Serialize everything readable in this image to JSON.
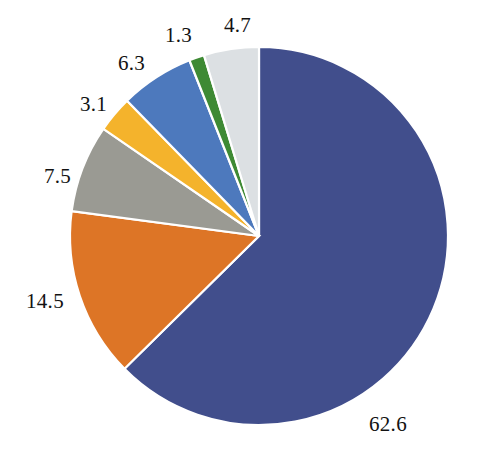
{
  "chart_data": {
    "type": "pie",
    "title": "",
    "subtitle": "",
    "xlabel": "",
    "ylabel": "",
    "grid": false,
    "legend_position": "none",
    "start_angle_deg": 0,
    "direction": "clockwise",
    "center": {
      "x": 259,
      "y": 236
    },
    "radius": 189,
    "categories": [
      "Segment 1",
      "Segment 2",
      "Segment 3",
      "Segment 4",
      "Segment 5",
      "Segment 6",
      "Segment 7"
    ],
    "values": [
      62.6,
      14.5,
      7.5,
      3.1,
      6.3,
      1.3,
      4.7
    ],
    "labels": [
      "62.6",
      "14.5",
      "7.5",
      "3.1",
      "6.3",
      "1.3",
      "4.7"
    ],
    "colors": [
      "#414E8C",
      "#DD7526",
      "#9A9A93",
      "#F4B32C",
      "#4D79BD",
      "#3E8A34",
      "#DCE0E3"
    ],
    "slices": [
      {
        "name": "slice-62-6",
        "label": "62.6",
        "value": 62.6,
        "color": "#414E8C",
        "label_pos": {
          "left": 369,
          "top": 414
        }
      },
      {
        "name": "slice-14-5",
        "label": "14.5",
        "value": 14.5,
        "color": "#DD7526",
        "label_pos": {
          "left": 26,
          "top": 291
        }
      },
      {
        "name": "slice-7-5",
        "label": "7.5",
        "value": 7.5,
        "color": "#9A9A93",
        "label_pos": {
          "left": 44,
          "top": 166
        }
      },
      {
        "name": "slice-3-1",
        "label": "3.1",
        "value": 3.1,
        "color": "#F4B32C",
        "label_pos": {
          "left": 80,
          "top": 94
        }
      },
      {
        "name": "slice-6-3",
        "label": "6.3",
        "value": 6.3,
        "color": "#4D79BD",
        "label_pos": {
          "left": 118,
          "top": 53
        }
      },
      {
        "name": "slice-1-3",
        "label": "1.3",
        "value": 1.3,
        "color": "#3E8A34",
        "label_pos": {
          "left": 165,
          "top": 25
        }
      },
      {
        "name": "slice-4-7",
        "label": "4.7",
        "value": 4.7,
        "color": "#DCE0E3",
        "label_pos": {
          "left": 224,
          "top": 15
        }
      }
    ],
    "total": 100.0
  }
}
